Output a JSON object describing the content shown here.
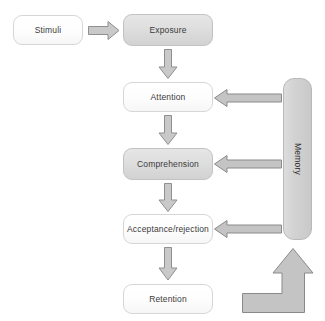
{
  "diagram": {
    "type": "flowchart",
    "canvas": {
      "width": 325,
      "height": 321
    },
    "palette": {
      "background": "#ffffff",
      "box_light_fill": "#fdfdfd",
      "box_shaded_fill": "#dedede",
      "box_border": "#cfcfcf",
      "memory_fill": "#d2d2d2",
      "arrow_fill": "#c9c9c9",
      "arrow_border": "#8f8f8f",
      "text": "#3a3a3a"
    },
    "nodes": [
      {
        "id": "stimuli",
        "label": "Stimuli",
        "style": "light",
        "x": 13,
        "y": 15,
        "w": 70,
        "h": 30
      },
      {
        "id": "exposure",
        "label": "Exposure",
        "style": "shaded",
        "x": 123,
        "y": 14,
        "w": 90,
        "h": 32
      },
      {
        "id": "attention",
        "label": "Attention",
        "style": "light",
        "x": 123,
        "y": 82,
        "w": 90,
        "h": 30
      },
      {
        "id": "comprehension",
        "label": "Comprehension",
        "style": "shaded",
        "x": 123,
        "y": 148,
        "w": 90,
        "h": 32
      },
      {
        "id": "acceptance",
        "label": "Acceptance/rejection",
        "style": "light",
        "x": 123,
        "y": 214,
        "w": 90,
        "h": 30
      },
      {
        "id": "retention",
        "label": "Retention",
        "style": "light",
        "x": 123,
        "y": 284,
        "w": 90,
        "h": 30
      },
      {
        "id": "memory",
        "label": "Memory",
        "style": "shaded",
        "x": 283,
        "y": 78,
        "w": 29,
        "h": 162,
        "orientation": "vertical"
      }
    ],
    "arrows": [
      {
        "id": "stimuli-to-exposure",
        "from": "stimuli",
        "to": "exposure",
        "direction": "right"
      },
      {
        "id": "exposure-to-attention",
        "from": "exposure",
        "to": "attention",
        "direction": "down"
      },
      {
        "id": "attention-to-comprehension",
        "from": "attention",
        "to": "comprehension",
        "direction": "down"
      },
      {
        "id": "comprehension-to-acceptance",
        "from": "comprehension",
        "to": "acceptance",
        "direction": "down"
      },
      {
        "id": "acceptance-to-retention",
        "from": "acceptance",
        "to": "retention",
        "direction": "down"
      },
      {
        "id": "memory-to-attention",
        "from": "memory",
        "to": "attention",
        "direction": "left"
      },
      {
        "id": "memory-to-comprehension",
        "from": "memory",
        "to": "comprehension",
        "direction": "left"
      },
      {
        "id": "memory-to-acceptance",
        "from": "memory",
        "to": "acceptance",
        "direction": "left"
      },
      {
        "id": "retention-to-memory",
        "from": "retention",
        "to": "memory",
        "direction": "elbow-up"
      }
    ]
  }
}
